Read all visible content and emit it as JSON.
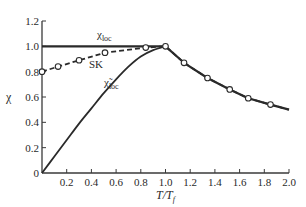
{
  "chart_data": {
    "type": "line",
    "title": "",
    "xlabel": "T/T_f",
    "ylabel": "χ",
    "xlim": [
      0,
      2.0
    ],
    "ylim": [
      0,
      1.2
    ],
    "grid": false,
    "legend": "inline labels",
    "x_ticks": [
      "0.2",
      "0.4",
      "0.6",
      "0.8",
      "1.0",
      "1.2",
      "1.4",
      "1.6",
      "1.8",
      "2.0"
    ],
    "y_ticks": [
      "0",
      "0.2",
      "0.4",
      "0.6",
      "0.8",
      "1.0",
      "1.2"
    ],
    "series": [
      {
        "name": "χ_loc",
        "label_main": "χ",
        "label_sub": "loc",
        "style": "solid-thick",
        "markers": false,
        "x": [
          0.0,
          1.0,
          1.15,
          1.34,
          1.52,
          1.67,
          1.85,
          2.0
        ],
        "y": [
          1.0,
          1.0,
          0.87,
          0.75,
          0.66,
          0.59,
          0.54,
          0.5
        ]
      },
      {
        "name": "SK",
        "label_main": "SK",
        "label_sub": "",
        "style": "dashed",
        "markers": true,
        "x": [
          0.0,
          0.13,
          0.3,
          0.51,
          0.84,
          1.0,
          1.15,
          1.34,
          1.52,
          1.67,
          1.85,
          2.0
        ],
        "y": [
          0.8,
          0.84,
          0.89,
          0.95,
          0.99,
          1.0,
          0.87,
          0.75,
          0.66,
          0.59,
          0.54,
          0.5
        ],
        "marker_x": [
          0.0,
          0.13,
          0.3,
          0.51,
          0.84,
          1.0,
          1.15,
          1.34,
          1.52,
          1.67,
          1.85
        ],
        "marker_y": [
          0.8,
          0.84,
          0.89,
          0.95,
          0.99,
          1.0,
          0.87,
          0.75,
          0.66,
          0.59,
          0.54
        ]
      },
      {
        "name": "χ̃_loc",
        "label_main": "χ̃",
        "label_sub": "loc",
        "style": "solid",
        "markers": false,
        "x": [
          0.0,
          0.1,
          0.2,
          0.3,
          0.4,
          0.5,
          0.6,
          0.7,
          0.8,
          0.9,
          1.0
        ],
        "y": [
          0.0,
          0.13,
          0.26,
          0.39,
          0.51,
          0.63,
          0.74,
          0.84,
          0.92,
          0.97,
          1.0
        ]
      }
    ],
    "colors": {
      "line": "#2a2a2a",
      "axis": "#3a3a3a",
      "marker_fill": "#ffffff"
    }
  },
  "labels": {
    "y_axis_symbol": "χ",
    "x_axis_main": "T/T",
    "x_axis_sub": "f",
    "chi_loc_main": "χ",
    "chi_loc_sub": "loc",
    "sk": "SK",
    "chi_tilde_main": "χ̃",
    "chi_tilde_sub": "loc"
  }
}
